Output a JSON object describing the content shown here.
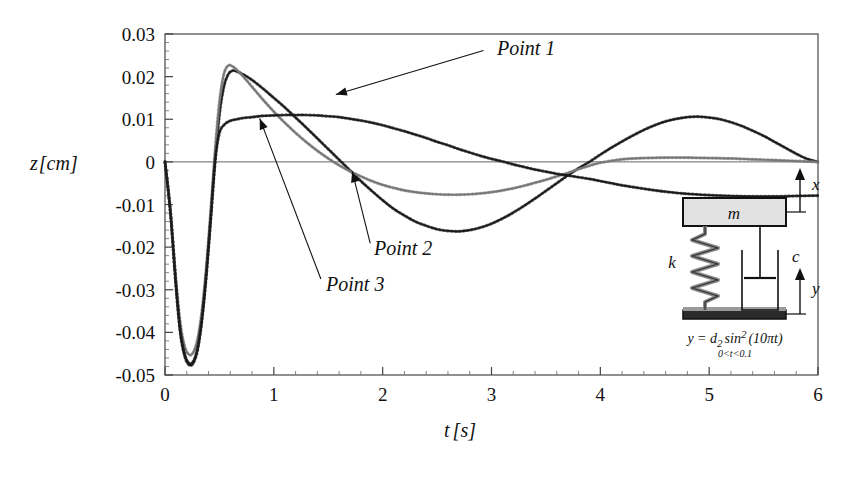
{
  "chart_data": {
    "type": "line",
    "title": "",
    "xlabel": "t [s]",
    "ylabel": "z [cm]",
    "xlim": [
      0,
      6
    ],
    "ylim": [
      -0.05,
      0.03
    ],
    "x_ticks": [
      "0",
      "1",
      "2",
      "3",
      "4",
      "5",
      "6"
    ],
    "y_ticks": [
      "0.03",
      "0.02",
      "0.01",
      "0",
      "-0.01",
      "-0.02",
      "-0.03",
      "-0.04",
      "-0.05"
    ],
    "x_minor_step": 0.2,
    "y_minor_step": 0.002,
    "grid": false,
    "legend": "none",
    "annotations": [
      {
        "label": "Point 1",
        "text_x": 3.05,
        "text_y": 0.0265,
        "tip_x": 1.57,
        "tip_y": 0.0158
      },
      {
        "label": "Point 2",
        "text_x": 1.92,
        "text_y": -0.0205,
        "tip_x": 1.72,
        "tip_y": -0.0022
      },
      {
        "label": "Point 3",
        "text_x": 1.48,
        "text_y": -0.0288,
        "tip_x": 0.87,
        "tip_y": 0.0102
      }
    ],
    "series": [
      {
        "name": "Point 1",
        "color": "#1a1a1a",
        "marker": "dotted-overlay",
        "x": [
          0.0,
          0.05,
          0.1,
          0.14,
          0.18,
          0.22,
          0.26,
          0.3,
          0.34,
          0.38,
          0.42,
          0.46,
          0.5,
          0.54,
          0.58,
          0.62,
          0.66,
          0.72,
          0.8,
          0.9,
          1.0,
          1.1,
          1.2,
          1.3,
          1.4,
          1.5,
          1.6,
          1.7,
          1.8,
          1.9,
          2.0,
          2.1,
          2.2,
          2.3,
          2.4,
          2.5,
          2.6,
          2.7,
          2.8,
          2.9,
          3.0,
          3.1,
          3.2,
          3.3,
          3.4,
          3.5,
          3.6,
          3.7,
          3.8,
          3.9,
          4.0,
          4.1,
          4.2,
          4.3,
          4.4,
          4.5,
          4.6,
          4.7,
          4.8,
          4.9,
          5.0,
          5.1,
          5.2,
          5.3,
          5.4,
          5.5,
          5.6,
          5.7,
          5.8,
          5.9,
          6.0
        ],
        "y": [
          0.0,
          -0.012,
          -0.029,
          -0.04,
          -0.0455,
          -0.0476,
          -0.0472,
          -0.044,
          -0.037,
          -0.0265,
          -0.0135,
          0.0,
          0.011,
          0.0175,
          0.0205,
          0.0214,
          0.0212,
          0.0205,
          0.0192,
          0.0172,
          0.015,
          0.0128,
          0.0104,
          0.008,
          0.0055,
          0.003,
          0.0005,
          -0.002,
          -0.0045,
          -0.0068,
          -0.009,
          -0.011,
          -0.0126,
          -0.014,
          -0.015,
          -0.0158,
          -0.0162,
          -0.0163,
          -0.016,
          -0.0154,
          -0.0145,
          -0.0133,
          -0.0119,
          -0.0103,
          -0.0086,
          -0.0068,
          -0.005,
          -0.0032,
          -0.0015,
          0.0,
          0.0017,
          0.0033,
          0.0048,
          0.0062,
          0.0075,
          0.0086,
          0.0095,
          0.0101,
          0.0105,
          0.0106,
          0.0104,
          0.01,
          0.0093,
          0.0084,
          0.0073,
          0.0061,
          0.0047,
          0.0033,
          0.0019,
          0.0007,
          0.0
        ]
      },
      {
        "name": "Point 2",
        "color": "#777777",
        "marker": "dotted-overlay",
        "x": [
          0.0,
          0.05,
          0.1,
          0.14,
          0.18,
          0.22,
          0.26,
          0.3,
          0.34,
          0.38,
          0.42,
          0.46,
          0.5,
          0.54,
          0.58,
          0.62,
          0.66,
          0.72,
          0.8,
          0.9,
          1.0,
          1.1,
          1.2,
          1.3,
          1.4,
          1.5,
          1.6,
          1.7,
          1.8,
          1.9,
          2.0,
          2.1,
          2.2,
          2.3,
          2.4,
          2.5,
          2.6,
          2.7,
          2.8,
          2.9,
          3.0,
          3.1,
          3.2,
          3.3,
          3.4,
          3.5,
          3.6,
          3.7,
          3.8,
          3.9,
          4.0,
          4.2,
          4.4,
          4.6,
          4.8,
          5.0,
          5.2,
          5.4,
          5.6,
          5.8,
          6.0
        ],
        "y": [
          0.0,
          -0.0115,
          -0.0275,
          -0.0378,
          -0.0432,
          -0.0452,
          -0.0447,
          -0.0415,
          -0.0348,
          -0.0245,
          -0.0115,
          0.0025,
          0.014,
          0.0205,
          0.0226,
          0.0224,
          0.0216,
          0.02,
          0.0176,
          0.0146,
          0.0118,
          0.0092,
          0.0068,
          0.0046,
          0.0026,
          0.0008,
          -0.0008,
          -0.0022,
          -0.0034,
          -0.0045,
          -0.0054,
          -0.0061,
          -0.0067,
          -0.0071,
          -0.0074,
          -0.0076,
          -0.0077,
          -0.0077,
          -0.0076,
          -0.0074,
          -0.0071,
          -0.0067,
          -0.0062,
          -0.0056,
          -0.0049,
          -0.0042,
          -0.0034,
          -0.0026,
          -0.0017,
          -0.0009,
          -0.0002,
          0.0006,
          0.0009,
          0.001,
          0.001,
          0.0009,
          0.0008,
          0.0006,
          0.0004,
          0.0002,
          0.0
        ]
      },
      {
        "name": "Point 3",
        "color": "#1a1a1a",
        "marker": "dotted-overlay",
        "x": [
          0.0,
          0.05,
          0.1,
          0.14,
          0.18,
          0.22,
          0.26,
          0.3,
          0.34,
          0.38,
          0.42,
          0.46,
          0.5,
          0.54,
          0.58,
          0.62,
          0.66,
          0.72,
          0.8,
          0.9,
          1.0,
          1.1,
          1.2,
          1.3,
          1.4,
          1.5,
          1.6,
          1.7,
          1.8,
          1.9,
          2.0,
          2.1,
          2.2,
          2.3,
          2.4,
          2.5,
          2.6,
          2.7,
          2.8,
          2.9,
          3.0,
          3.1,
          3.2,
          3.3,
          3.4,
          3.5,
          3.6,
          3.7,
          3.8,
          3.9,
          4.0,
          4.1,
          4.2,
          4.4,
          4.6,
          4.8,
          5.0,
          5.2,
          5.4,
          5.6,
          5.8,
          6.0
        ],
        "y": [
          0.0,
          -0.0118,
          -0.0285,
          -0.0394,
          -0.045,
          -0.0472,
          -0.0468,
          -0.0436,
          -0.0366,
          -0.0262,
          -0.0132,
          0.0002,
          0.0068,
          0.0086,
          0.0094,
          0.0098,
          0.01,
          0.0103,
          0.0105,
          0.0108,
          0.0109,
          0.011,
          0.011,
          0.011,
          0.0109,
          0.0107,
          0.0105,
          0.0101,
          0.0097,
          0.0092,
          0.0086,
          0.0079,
          0.0072,
          0.0064,
          0.0056,
          0.0047,
          0.0039,
          0.003,
          0.0022,
          0.0014,
          0.0007,
          0.0001,
          -0.0006,
          -0.0012,
          -0.0018,
          -0.0023,
          -0.0028,
          -0.0032,
          -0.0036,
          -0.004,
          -0.0045,
          -0.005,
          -0.0055,
          -0.0063,
          -0.007,
          -0.0075,
          -0.0078,
          -0.008,
          -0.0081,
          -0.0081,
          -0.008,
          -0.0079
        ]
      }
    ]
  },
  "inset": {
    "mass_label": "m",
    "spring_label": "k",
    "damper_label": "c",
    "top_disp_label": "x",
    "base_disp_label": "y",
    "equation_main": "y = d",
    "equation_sub": "2",
    "equation_sin": "sin",
    "equation_exp": "2",
    "equation_arg": "(10πt)",
    "equation_range": "0<t<0.1"
  }
}
